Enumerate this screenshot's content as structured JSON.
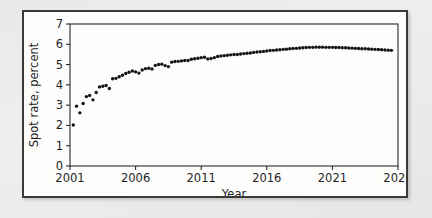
{
  "figure": {
    "background_color": "#ebebeb",
    "panel_background": "#fdfdfc",
    "panel_border_color": "#3a3a3a",
    "marker_color": "#141414"
  },
  "chart_data": {
    "type": "scatter",
    "title": "",
    "subtitle": "",
    "xlabel": "Year",
    "ylabel": "Spot rate, percent",
    "xlim": [
      2001,
      2026
    ],
    "ylim": [
      0,
      7
    ],
    "grid": false,
    "legend": [],
    "legend_position": "none",
    "x_ticks": [
      2001,
      2006,
      2011,
      2016,
      2021,
      2026
    ],
    "x_tick_labels": [
      "2001",
      "2006",
      "2011",
      "2016",
      "2021",
      "2026"
    ],
    "y_ticks": [
      0,
      1,
      2,
      3,
      4,
      5,
      6,
      7
    ],
    "y_tick_labels": [
      "0",
      "1",
      "2",
      "3",
      "4",
      "5",
      "6",
      "7"
    ],
    "series": [
      {
        "name": "Spot rate",
        "marker": "circle",
        "x": [
          2001.25,
          2001.5,
          2001.75,
          2002.0,
          2002.25,
          2002.5,
          2002.75,
          2003.0,
          2003.25,
          2003.5,
          2003.75,
          2004.0,
          2004.25,
          2004.5,
          2004.75,
          2005.0,
          2005.25,
          2005.5,
          2005.75,
          2006.0,
          2006.25,
          2006.5,
          2006.75,
          2007.0,
          2007.25,
          2007.5,
          2007.75,
          2008.0,
          2008.25,
          2008.5,
          2008.75,
          2009.0,
          2009.25,
          2009.5,
          2009.75,
          2010.0,
          2010.25,
          2010.5,
          2010.75,
          2011.0,
          2011.25,
          2011.5,
          2011.75,
          2012.0,
          2012.25,
          2012.5,
          2012.75,
          2013.0,
          2013.25,
          2013.5,
          2013.75,
          2014.0,
          2014.25,
          2014.5,
          2014.75,
          2015.0,
          2015.25,
          2015.5,
          2015.75,
          2016.0,
          2016.25,
          2016.5,
          2016.75,
          2017.0,
          2017.25,
          2017.5,
          2017.75,
          2018.0,
          2018.25,
          2018.5,
          2018.75,
          2019.0,
          2019.25,
          2019.5,
          2019.75,
          2020.0,
          2020.25,
          2020.5,
          2020.75,
          2021.0,
          2021.25,
          2021.5,
          2021.75,
          2022.0,
          2022.25,
          2022.5,
          2022.75,
          2023.0,
          2023.25,
          2023.5,
          2023.75,
          2024.0,
          2024.25,
          2024.5,
          2024.75,
          2025.0,
          2025.25,
          2025.5
        ],
        "y": [
          2.02,
          2.95,
          2.62,
          3.08,
          3.42,
          3.48,
          3.26,
          3.62,
          3.9,
          3.93,
          3.97,
          3.82,
          4.3,
          4.32,
          4.4,
          4.47,
          4.56,
          4.62,
          4.68,
          4.64,
          4.58,
          4.73,
          4.8,
          4.82,
          4.78,
          4.96,
          5.0,
          5.02,
          4.95,
          4.9,
          5.12,
          5.15,
          5.16,
          5.18,
          5.2,
          5.2,
          5.26,
          5.29,
          5.31,
          5.34,
          5.36,
          5.28,
          5.3,
          5.34,
          5.4,
          5.42,
          5.44,
          5.46,
          5.48,
          5.5,
          5.5,
          5.52,
          5.54,
          5.56,
          5.57,
          5.6,
          5.62,
          5.63,
          5.65,
          5.67,
          5.69,
          5.7,
          5.72,
          5.73,
          5.75,
          5.76,
          5.78,
          5.79,
          5.8,
          5.82,
          5.83,
          5.84,
          5.85,
          5.85,
          5.86,
          5.86,
          5.86,
          5.85,
          5.85,
          5.85,
          5.84,
          5.84,
          5.83,
          5.83,
          5.82,
          5.81,
          5.8,
          5.79,
          5.78,
          5.78,
          5.77,
          5.76,
          5.75,
          5.74,
          5.73,
          5.72,
          5.71,
          5.7
        ]
      }
    ]
  }
}
